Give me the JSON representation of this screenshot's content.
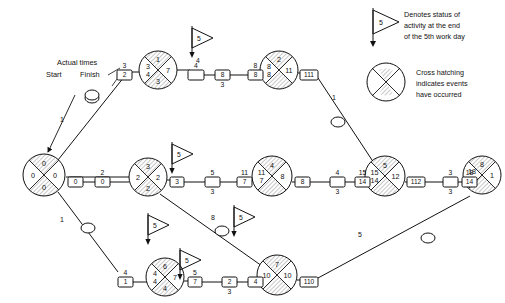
{
  "diagram": {
    "type": "project-network-diagram"
  },
  "annotations": {
    "actual_times": "Actual times",
    "start": "Start",
    "finish": "Finish"
  },
  "legend": {
    "flag": {
      "value": "5",
      "line1": "Denotes status of",
      "line2": "activity at the end",
      "line3": "of the 5th work day"
    },
    "hatch": {
      "line1": "Cross hatching",
      "line2": "indicates events",
      "line3": "have occurred"
    }
  },
  "events": [
    {
      "id": "start",
      "name": "event-start",
      "cx": 44,
      "cy": 175,
      "r": 21,
      "top": "0",
      "right": "0",
      "bottom": "0",
      "left": "0",
      "left2": "",
      "hatched": true
    },
    {
      "id": "e7",
      "name": "event-7",
      "cx": 158,
      "cy": 70,
      "r": 19,
      "top": "1",
      "right": "7",
      "bottom": "3",
      "left": "3",
      "left2": "4",
      "hatched": true
    },
    {
      "id": "e11",
      "name": "event-11",
      "cx": 279,
      "cy": 70,
      "r": 19,
      "top": "2",
      "right": "11",
      "bottom": "",
      "left": "8",
      "left2": "8",
      "hatched": true
    },
    {
      "id": "e2",
      "name": "event-2",
      "cx": 148,
      "cy": 177,
      "r": 19,
      "top": "3",
      "right": "2",
      "bottom": "2",
      "left": "2",
      "left2": "",
      "hatched": true
    },
    {
      "id": "e8",
      "name": "event-8",
      "cx": 272,
      "cy": 176,
      "r": 20,
      "top": "4",
      "right": "8",
      "bottom": "",
      "left": "11",
      "left2": "7",
      "hatched": true
    },
    {
      "id": "e12",
      "name": "event-12",
      "cx": 385,
      "cy": 176,
      "r": 20,
      "top": "5",
      "right": "12",
      "bottom": "",
      "left": "15",
      "left2": "14",
      "hatched": true
    },
    {
      "id": "e18",
      "name": "event-end",
      "cx": 482,
      "cy": 175,
      "r": 19,
      "top": "8",
      "right": "1",
      "bottom": "",
      "left": "18",
      "left2": "18",
      "hatched": true
    },
    {
      "id": "e7b",
      "name": "event-7-lower",
      "cx": 165,
      "cy": 277,
      "r": 19,
      "top": "6",
      "right": "7",
      "bottom": "4",
      "left": "4",
      "left2": "4",
      "hatched": true
    },
    {
      "id": "e10",
      "name": "event-10",
      "cx": 277,
      "cy": 275,
      "r": 20,
      "top": "7",
      "right": "10",
      "bottom": "",
      "left": "10",
      "left2": "",
      "hatched": true
    }
  ],
  "activity_boxes": [
    {
      "name": "activity-box-start-top",
      "x": 117,
      "y": 70,
      "w": 15,
      "h": 10,
      "value": "2",
      "above": "3",
      "below": ""
    },
    {
      "name": "activity-box-7-out",
      "x": 188,
      "y": 70,
      "w": 16,
      "h": 10,
      "value": "",
      "above": "4",
      "below": ""
    },
    {
      "name": "activity-box-top-mid",
      "x": 215,
      "y": 70,
      "w": 15,
      "h": 10,
      "value": "8",
      "above": "",
      "below": "3"
    },
    {
      "name": "activity-box-top-11in",
      "x": 248,
      "y": 70,
      "w": 15,
      "h": 10,
      "value": "8",
      "above": "8",
      "below": ""
    },
    {
      "name": "activity-box-111",
      "x": 300,
      "y": 70,
      "w": 18,
      "h": 10,
      "value": "111",
      "above": "",
      "below": ""
    },
    {
      "name": "activity-box-start-mid",
      "x": 68,
      "y": 177,
      "w": 15,
      "h": 10,
      "value": "0",
      "above": "",
      "below": ""
    },
    {
      "name": "activity-box-mid-a",
      "x": 95,
      "y": 177,
      "w": 15,
      "h": 10,
      "value": "0",
      "above": "2",
      "below": ""
    },
    {
      "name": "activity-box-2-out",
      "x": 170,
      "y": 177,
      "w": 14,
      "h": 10,
      "value": "3",
      "above": "",
      "below": ""
    },
    {
      "name": "activity-box-mid-b",
      "x": 205,
      "y": 177,
      "w": 15,
      "h": 10,
      "value": "",
      "above": "5",
      "below": "3"
    },
    {
      "name": "activity-box-mid-c",
      "x": 237,
      "y": 177,
      "w": 15,
      "h": 10,
      "value": "7",
      "above": "11",
      "below": ""
    },
    {
      "name": "activity-box-8-out",
      "x": 295,
      "y": 177,
      "w": 15,
      "h": 10,
      "value": "8",
      "above": "",
      "below": ""
    },
    {
      "name": "activity-box-mid-d",
      "x": 330,
      "y": 177,
      "w": 15,
      "h": 10,
      "value": "",
      "above": "4",
      "below": "3"
    },
    {
      "name": "activity-box-mid-e",
      "x": 355,
      "y": 177,
      "w": 15,
      "h": 10,
      "value": "14",
      "above": "15",
      "below": ""
    },
    {
      "name": "activity-box-112",
      "x": 407,
      "y": 177,
      "w": 18,
      "h": 10,
      "value": "112",
      "above": "",
      "below": ""
    },
    {
      "name": "activity-box-mid-f",
      "x": 443,
      "y": 177,
      "w": 15,
      "h": 10,
      "value": "",
      "above": "3",
      "below": "3"
    },
    {
      "name": "activity-box-mid-g",
      "x": 462,
      "y": 177,
      "w": 15,
      "h": 10,
      "value": "14",
      "above": "18",
      "below": ""
    },
    {
      "name": "activity-box-bot-a",
      "x": 118,
      "y": 277,
      "w": 15,
      "h": 10,
      "value": "1",
      "above": "4",
      "below": ""
    },
    {
      "name": "activity-box-7b-out",
      "x": 188,
      "y": 277,
      "w": 14,
      "h": 10,
      "value": "7",
      "above": "5",
      "below": ""
    },
    {
      "name": "activity-box-bot-b",
      "x": 222,
      "y": 277,
      "w": 15,
      "h": 10,
      "value": "2",
      "above": "",
      "below": "3"
    },
    {
      "name": "activity-box-bot-c",
      "x": 248,
      "y": 277,
      "w": 15,
      "h": 10,
      "value": "4",
      "above": "",
      "below": ""
    },
    {
      "name": "activity-box-110",
      "x": 300,
      "y": 277,
      "w": 18,
      "h": 10,
      "value": "110",
      "above": "",
      "below": ""
    }
  ],
  "edge_markers": [
    {
      "name": "edge-marker-start-up",
      "x": 92,
      "y": 98,
      "value": "0",
      "edge_label": "1"
    },
    {
      "name": "edge-marker-start-down",
      "x": 88,
      "y": 228,
      "value": "",
      "edge_label": "1"
    },
    {
      "name": "edge-marker-11-12",
      "x": 338,
      "y": 122,
      "value": "",
      "edge_label": "1"
    },
    {
      "name": "edge-marker-diag-2-10",
      "x": 222,
      "y": 231,
      "value": "",
      "edge_label": "8"
    },
    {
      "name": "edge-marker-10-12",
      "x": 428,
      "y": 238,
      "value": "",
      "edge_label": "5"
    },
    {
      "name": "edge-marker-topstart",
      "x": 92,
      "y": 95,
      "value": "",
      "edge_label": ""
    }
  ],
  "flags": [
    {
      "name": "flag-top",
      "x": 192,
      "y": 26,
      "value": "5",
      "tail": "4"
    },
    {
      "name": "flag-mid",
      "x": 172,
      "y": 142,
      "value": "5",
      "tail": ""
    },
    {
      "name": "flag-diag",
      "x": 234,
      "y": 205,
      "value": "5",
      "tail": ""
    },
    {
      "name": "flag-lower-left",
      "x": 148,
      "y": 213,
      "value": "5",
      "tail": ""
    },
    {
      "name": "flag-bottom",
      "x": 180,
      "y": 248,
      "value": "5",
      "tail": ""
    }
  ],
  "edge_numbers": [
    {
      "name": "edge-num-start-7",
      "x": 62,
      "y": 122,
      "value": "1"
    },
    {
      "name": "edge-num-start-7b",
      "x": 62,
      "y": 222,
      "value": "1"
    },
    {
      "name": "edge-num-11-12",
      "x": 334,
      "y": 100,
      "value": "1"
    },
    {
      "name": "edge-num-2-10",
      "x": 213,
      "y": 220,
      "value": "8"
    },
    {
      "name": "edge-num-10-12",
      "x": 360,
      "y": 237,
      "value": "5"
    }
  ]
}
